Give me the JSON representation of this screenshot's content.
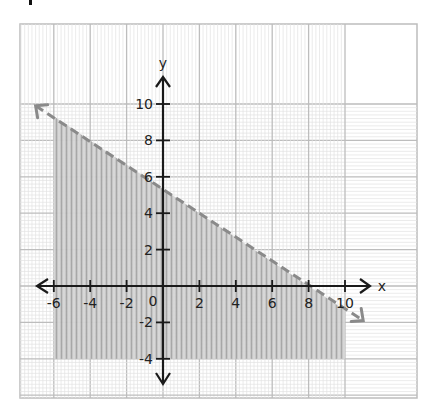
{
  "chart_data": {
    "type": "inequality-graph",
    "title": "",
    "xlabel": "x",
    "ylabel": "y",
    "xlim": [
      -8,
      12
    ],
    "ylim": [
      -6,
      14
    ],
    "grid": true,
    "x_ticks": [
      -6,
      -4,
      -2,
      2,
      4,
      6,
      8,
      10
    ],
    "x_tick_labels": [
      "-6",
      "-4",
      "-2",
      "0",
      "2",
      "4",
      "6",
      "8",
      "10"
    ],
    "y_ticks": [
      10,
      8,
      6,
      4,
      2,
      -2,
      -4
    ],
    "y_tick_labels": [
      "10",
      "8",
      "6",
      "4",
      "2",
      "-2",
      "-4"
    ],
    "origin_label": "0",
    "boundary_line": {
      "equation": "2x + 3y = 16",
      "style": "dashed",
      "slope": -0.6667,
      "y_intercept": 5.33,
      "x_intercept": 8,
      "arrow_start": [
        -7.0,
        9.9
      ],
      "arrow_end": [
        11.0,
        -1.9
      ]
    },
    "shaded_region": {
      "description": "below the dashed line",
      "inequality": "2x + 3y < 16",
      "x_range": [
        -6,
        10
      ],
      "y_bottom": -4
    },
    "colors": {
      "axis": "#1a1a1a",
      "boundary": "#8a8a8a",
      "shade": "#a9a9a9",
      "grid_major": "#bdbdbd",
      "grid_minor": "#e3e3e3"
    }
  }
}
